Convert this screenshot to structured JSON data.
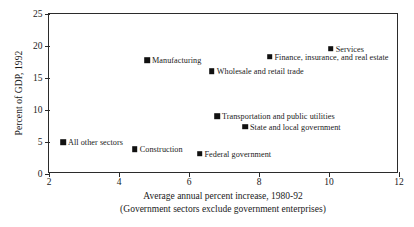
{
  "chart_data": {
    "type": "scatter",
    "title": "",
    "xlabel": "Average annual percent increase, 1980-92",
    "xlabel_line2": "(Government sectors exclude government enterprises)",
    "ylabel": "Percent of GDP, 1992",
    "xlim": [
      2,
      12
    ],
    "ylim": [
      0,
      25
    ],
    "xticks": [
      "2",
      "4",
      "6",
      "8",
      "10",
      "12"
    ],
    "yticks": [
      "0",
      "5",
      "10",
      "15",
      "20",
      "25"
    ],
    "grid": false,
    "legend": "none",
    "marker_color": "#111111",
    "axis_color": "#2b2b2b",
    "points": [
      {
        "label": "All other sectors",
        "x": 2.4,
        "y": 5.0,
        "label_side": "right"
      },
      {
        "label": "Construction",
        "x": 4.45,
        "y": 3.9,
        "label_side": "right"
      },
      {
        "label": "Manufacturing",
        "x": 4.8,
        "y": 17.8,
        "label_side": "right"
      },
      {
        "label": "Federal government",
        "x": 6.3,
        "y": 3.2,
        "label_side": "right"
      },
      {
        "label": "Wholesale and retail trade",
        "x": 6.65,
        "y": 16.1,
        "label_side": "right"
      },
      {
        "label": "Transportation and public utilities",
        "x": 6.8,
        "y": 9.0,
        "label_side": "right"
      },
      {
        "label": "State and local government",
        "x": 7.6,
        "y": 7.4,
        "label_side": "right"
      },
      {
        "label": "Finance, insurance, and real estate",
        "x": 8.3,
        "y": 18.3,
        "label_side": "right"
      },
      {
        "label": "Services",
        "x": 10.05,
        "y": 19.6,
        "label_side": "right"
      }
    ]
  }
}
